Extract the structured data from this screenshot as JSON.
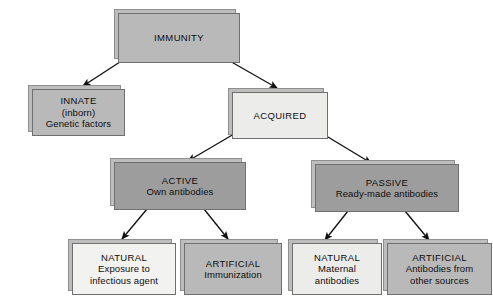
{
  "diagram": {
    "title": "IMMUNITY",
    "background_color": "#ffffff",
    "text_color": "#0d0d0d",
    "colors": {
      "mid_gray": "#b9b9b9",
      "light_gray": "#ececeb",
      "dark_gray": "#9d9d9d",
      "pale_gray": "#f2f2f1",
      "plate_gray": "#bdbdbd",
      "border_gray": "#6f6f6f",
      "arrow_black": "#111111"
    },
    "nodes": {
      "immunity": {
        "lines": [
          "IMMUNITY"
        ],
        "shade": "mid_gray"
      },
      "innate": {
        "lines": [
          "INNATE",
          "(inborn)",
          "Genetic factors"
        ],
        "shade": "mid_gray"
      },
      "acquired": {
        "lines": [
          "ACQUIRED"
        ],
        "shade": "light_gray"
      },
      "active": {
        "lines": [
          "ACTIVE",
          "Own antibodies"
        ],
        "shade": "dark_gray"
      },
      "passive": {
        "lines": [
          "PASSIVE",
          "Ready-made antibodies"
        ],
        "shade": "dark_gray"
      },
      "active_natural": {
        "lines": [
          "NATURAL",
          "Exposure to",
          "infectious agent"
        ],
        "shade": "pale_gray"
      },
      "active_artificial": {
        "lines": [
          "ARTIFICIAL",
          "Immunization"
        ],
        "shade": "mid_gray"
      },
      "passive_natural": {
        "lines": [
          "NATURAL",
          "Maternal",
          "antibodies"
        ],
        "shade": "light_gray"
      },
      "passive_artificial": {
        "lines": [
          "ARTIFICIAL",
          "Antibodies from",
          "other sources"
        ],
        "shade": "mid_gray"
      }
    },
    "edges": [
      {
        "from": "immunity",
        "to": "innate"
      },
      {
        "from": "immunity",
        "to": "acquired"
      },
      {
        "from": "acquired",
        "to": "active"
      },
      {
        "from": "acquired",
        "to": "passive"
      },
      {
        "from": "active",
        "to": "active_natural"
      },
      {
        "from": "active",
        "to": "active_artificial"
      },
      {
        "from": "passive",
        "to": "passive_natural"
      },
      {
        "from": "passive",
        "to": "passive_artificial"
      }
    ]
  }
}
